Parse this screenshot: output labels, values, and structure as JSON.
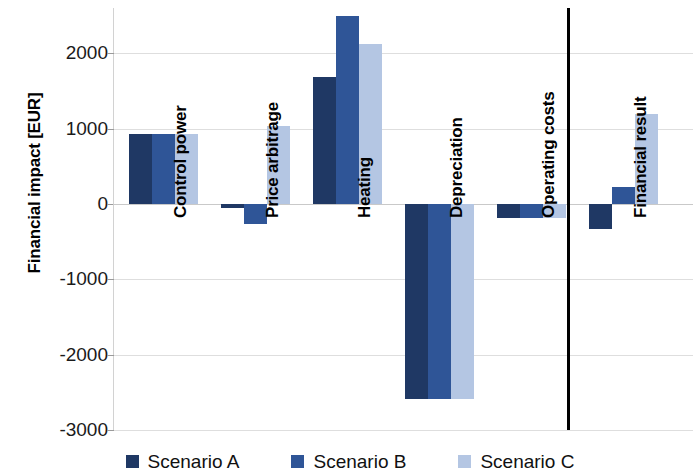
{
  "chart_data": {
    "type": "bar",
    "title": "",
    "subtitle": "",
    "xlabel": "",
    "ylabel": "Financial impact [EUR]",
    "ylim": [
      -3000,
      2600
    ],
    "yticks": [
      2000,
      1000,
      0,
      -1000,
      -2000,
      -3000
    ],
    "ytick_labels": [
      "2000",
      "1000",
      "0",
      "-1000",
      "-2000",
      "-3000"
    ],
    "grid": true,
    "legend_position": "bottom",
    "orientation": "vertical",
    "grouped": true,
    "categories": [
      "Control power",
      "Price arbitrage",
      "Heating",
      "Depreciation",
      "Operating costs",
      "Financial result"
    ],
    "series": [
      {
        "name": "Scenario A",
        "color": "#1f3864",
        "values": [
          930,
          -60,
          1690,
          -2590,
          -190,
          -330
        ]
      },
      {
        "name": "Scenario B",
        "color": "#2f5597",
        "values": [
          930,
          -270,
          2500,
          -2590,
          -190,
          230
        ]
      },
      {
        "name": "Scenario C",
        "color": "#b4c6e3",
        "values": [
          930,
          1030,
          2120,
          -2590,
          -190,
          1190
        ]
      }
    ],
    "annotations": [
      {
        "type": "vertical-separator",
        "description": "black vertical divider separating component categories from the Financial result total",
        "before_category": "Financial result"
      }
    ]
  },
  "legend": {
    "items": [
      {
        "label": "Scenario A",
        "color": "#1f3864"
      },
      {
        "label": "Scenario B",
        "color": "#2f5597"
      },
      {
        "label": "Scenario C",
        "color": "#b4c6e3"
      }
    ]
  }
}
